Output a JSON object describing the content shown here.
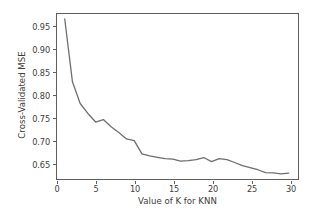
{
  "chart_data": {
    "type": "line",
    "title": "",
    "xlabel": "Value of K for KNN",
    "ylabel": "Cross-Validated MSE",
    "xlim": [
      0,
      31.2
    ],
    "ylim": [
      0.6175,
      0.9825
    ],
    "grid": false,
    "legend": null,
    "line_color": "#6e6e6e",
    "line_width": 1.3,
    "xticks": [
      0,
      5,
      10,
      15,
      20,
      25,
      30
    ],
    "xtick_labels": [
      "0",
      "5",
      "10",
      "15",
      "20",
      "25",
      "30"
    ],
    "yticks": [
      0.65,
      0.7,
      0.75,
      0.8,
      0.85,
      0.9,
      0.95
    ],
    "ytick_labels": [
      "0.65",
      "0.70",
      "0.75",
      "0.80",
      "0.85",
      "0.90",
      "0.95"
    ],
    "series": [
      {
        "name": "Cross-Validated MSE",
        "x": [
          1,
          2,
          3,
          4,
          5,
          6,
          7,
          8,
          9,
          10,
          11,
          12,
          13,
          14,
          15,
          16,
          17,
          18,
          19,
          20,
          21,
          22,
          23,
          24,
          25,
          26,
          27,
          28,
          29,
          30
        ],
        "values": [
          0.9715,
          0.8325,
          0.7845,
          0.7625,
          0.7435,
          0.749,
          0.733,
          0.7205,
          0.706,
          0.7025,
          0.673,
          0.6685,
          0.6655,
          0.6625,
          0.6615,
          0.657,
          0.658,
          0.6605,
          0.665,
          0.656,
          0.6625,
          0.6605,
          0.654,
          0.647,
          0.6425,
          0.638,
          0.6315,
          0.631,
          0.629,
          0.6305
        ]
      }
    ]
  }
}
